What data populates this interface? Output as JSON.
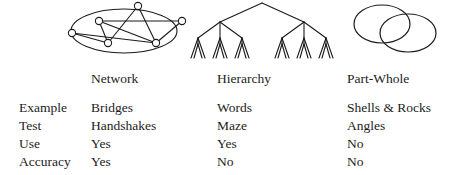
{
  "figure": {
    "background_color": "#ffffff",
    "ink_color": "#1a1a1a"
  },
  "diagrams": [
    {
      "name": "network-graph",
      "caption": "Network",
      "shape": "graph with nodes and edges enclosed in an ellipse",
      "node_count": 7,
      "nodes": [
        {
          "id": "n1",
          "cx": 14,
          "cy": 33
        },
        {
          "id": "n2",
          "cx": 41,
          "cy": 21
        },
        {
          "id": "n3",
          "cx": 50,
          "cy": 43
        },
        {
          "id": "n4",
          "cx": 80,
          "cy": 6
        },
        {
          "id": "n5",
          "cx": 98,
          "cy": 43
        },
        {
          "id": "n6",
          "cx": 124,
          "cy": 21
        },
        {
          "id": "n7",
          "cx": 66,
          "cy": 50
        }
      ],
      "edges": [
        [
          "n1",
          "n3"
        ],
        [
          "n2",
          "n3"
        ],
        [
          "n2",
          "n6"
        ],
        [
          "n2",
          "n5"
        ],
        [
          "n3",
          "n4"
        ],
        [
          "n4",
          "n2"
        ],
        [
          "n4",
          "n5"
        ],
        [
          "n5",
          "n6"
        ],
        [
          "n1",
          "n5"
        ]
      ]
    },
    {
      "name": "hierarchy-tree",
      "caption": "Hierarchy",
      "shape": "balanced tree, root branching to 2, then 3, then 2 leaves",
      "levels": 4,
      "root_children": 2,
      "second_level_children": 3,
      "leaf_count": 24
    },
    {
      "name": "part-whole-venn",
      "caption": "Part-Whole",
      "shape": "two overlapping ellipses",
      "circle_count": 2
    }
  ],
  "table": {
    "row_labels": [
      "Example",
      "Test",
      "Use",
      "Accuracy"
    ],
    "columns": [
      {
        "key": "network",
        "header": "Network",
        "values": [
          "Bridges",
          "Handshakes",
          "Yes",
          "Yes"
        ]
      },
      {
        "key": "hierarchy",
        "header": "Hierarchy",
        "values": [
          "Words",
          "Maze",
          "Yes",
          "No"
        ]
      },
      {
        "key": "partwhole",
        "header": "Part-Whole",
        "values": [
          "Shells & Rocks",
          "Angles",
          "No",
          "No"
        ]
      }
    ]
  }
}
